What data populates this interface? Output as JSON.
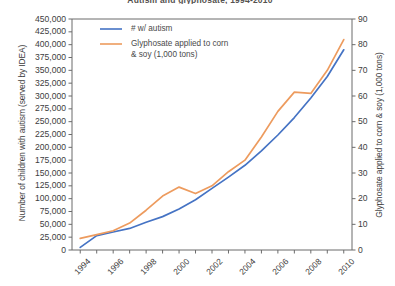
{
  "chart_data": {
    "type": "line",
    "title": "Autism and glyphosate, 1994-2010",
    "xlabel": "",
    "ylabel": "Number of children with autism (served by IDEA)",
    "ylabel_right": "Glyphosate applied to corn & soy (1,000 tons)",
    "x": [
      1994,
      1995,
      1996,
      1997,
      1998,
      1999,
      2000,
      2001,
      2002,
      2003,
      2004,
      2005,
      2006,
      2007,
      2008,
      2009,
      2010
    ],
    "xlim": [
      1993.5,
      2010.5
    ],
    "xticks": [
      1994,
      1995,
      1996,
      1997,
      1998,
      1999,
      2000,
      2001,
      2002,
      2003,
      2004,
      2005,
      2006,
      2007,
      2008,
      2009,
      2010
    ],
    "xticklabels": [
      "1994",
      "",
      "1996",
      "",
      "1998",
      "",
      "2000",
      "",
      "2002",
      "",
      "2004",
      "",
      "2006",
      "",
      "2008",
      "",
      "2010"
    ],
    "ylim": [
      0,
      450000
    ],
    "yticks": [
      0,
      25000,
      50000,
      75000,
      100000,
      125000,
      150000,
      175000,
      200000,
      225000,
      250000,
      275000,
      300000,
      325000,
      350000,
      375000,
      400000,
      425000,
      450000
    ],
    "yticklabels": [
      "0",
      "25,000",
      "50,000",
      "75,000",
      "100,000",
      "125,000",
      "150,000",
      "175,000",
      "200,000",
      "225,000",
      "250,000",
      "275,000",
      "300,000",
      "325,000",
      "350,000",
      "375,000",
      "400,000",
      "425,000",
      "450,000"
    ],
    "ylim_right": [
      0,
      90
    ],
    "yticks_right": [
      0,
      10,
      20,
      30,
      40,
      50,
      60,
      70,
      80,
      90
    ],
    "yticklabels_right": [
      "0",
      "10",
      "20",
      "30",
      "40",
      "50",
      "60",
      "70",
      "80",
      "90"
    ],
    "grid": false,
    "legend_position": "upper left",
    "series": [
      {
        "name": "# w/ autism",
        "axis": "left",
        "color": "#4573c4",
        "values": [
          5000,
          28000,
          35000,
          42000,
          54000,
          65000,
          80000,
          98000,
          120000,
          142000,
          165000,
          193000,
          224000,
          258000,
          296000,
          338000,
          390000
        ]
      },
      {
        "name": "Glyphosate applied to corn & soy (1,000 tons)",
        "axis": "right",
        "color": "#ed9b5e",
        "values": [
          4.5,
          6.0,
          7.5,
          10.5,
          15.5,
          21.0,
          24.5,
          22.0,
          25.0,
          30.5,
          35.0,
          44.0,
          54.0,
          61.5,
          61.0,
          70.0,
          82.0
        ]
      }
    ]
  },
  "legend": {
    "autism_label": "# w/ autism",
    "glyphosate_label_line1": "Glyphosate applied to corn",
    "glyphosate_label_line2": "& soy (1,000 tons)"
  },
  "colors": {
    "autism_line": "#4573c4",
    "glyphosate_line": "#ed9b5e",
    "axis": "#6b6b6b",
    "text": "#3d3d3d",
    "background": "#ffffff"
  }
}
